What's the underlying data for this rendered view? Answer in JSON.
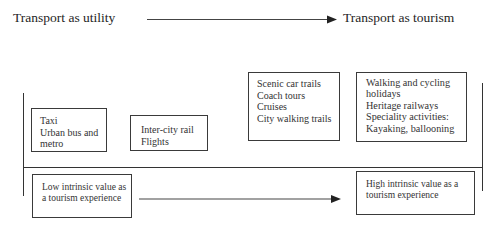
{
  "header": {
    "left_title": "Transport as utility",
    "right_title": "Transport as tourism"
  },
  "boxes": {
    "utility_low": {
      "lines": [
        "Taxi",
        "Urban bus and",
        "metro"
      ]
    },
    "utility_mid": {
      "lines": [
        "Inter-city rail",
        "Flights"
      ]
    },
    "tourism_mid": {
      "lines": [
        "Scenic car trails",
        "Coach tours",
        "Cruises",
        "City walking trails"
      ]
    },
    "tourism_high": {
      "lines": [
        "Walking and cycling",
        "holidays",
        "Heritage railways",
        "Speciality activities:",
        "Kayaking, ballooning"
      ]
    }
  },
  "scale": {
    "low_label_lines": [
      "Low intrinsic value as",
      "a tourism experience"
    ],
    "high_label_lines": [
      "High intrinsic value as a",
      "tourism experience"
    ]
  },
  "colors": {
    "line": "#333333",
    "text": "#222222",
    "background": "#ffffff"
  }
}
